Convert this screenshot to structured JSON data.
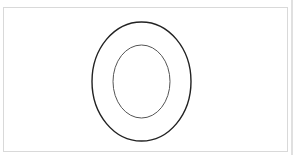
{
  "diagram": {
    "type": "concentric-ellipses",
    "frame": {
      "border_color": "#d9d9d9",
      "background": "#ffffff"
    },
    "edge_strip_color": "#e0e0e0",
    "outer_ellipse": {
      "cx": 141.5,
      "cy": 81.5,
      "rx": 49.5,
      "ry": 59.5,
      "stroke": "#222222",
      "stroke_width": 1.4
    },
    "inner_ellipse": {
      "cx": 141.5,
      "cy": 81.5,
      "rx": 28.5,
      "ry": 36.5,
      "stroke": "#555555",
      "stroke_width": 1
    }
  }
}
